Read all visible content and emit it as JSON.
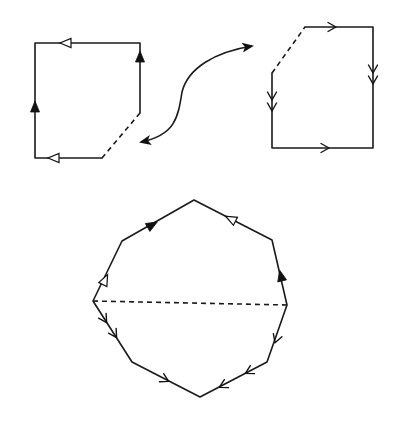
{
  "figure": {
    "line_color": "#1a1a1a",
    "background": "#ffffff",
    "pieces": [
      {
        "name": "left-piece",
        "edges": [
          {
            "name": "top",
            "style": "solid",
            "arrow": "open-triangle",
            "direction": "leftward"
          },
          {
            "name": "right",
            "style": "solid",
            "arrow": "filled-triangle",
            "direction": "upward"
          },
          {
            "name": "diagonal",
            "style": "dashed",
            "arrow": "none"
          },
          {
            "name": "bottom",
            "style": "solid",
            "arrow": "open-triangle",
            "direction": "leftward"
          },
          {
            "name": "left",
            "style": "solid",
            "arrow": "filled-triangle",
            "direction": "upward"
          }
        ]
      },
      {
        "name": "right-piece",
        "edges": [
          {
            "name": "top",
            "style": "solid",
            "arrow": "single-chevron",
            "direction": "rightward"
          },
          {
            "name": "right",
            "style": "solid",
            "arrow": "double-chevron",
            "direction": "downward"
          },
          {
            "name": "bottom",
            "style": "solid",
            "arrow": "single-chevron",
            "direction": "rightward"
          },
          {
            "name": "left",
            "style": "solid",
            "arrow": "double-chevron",
            "direction": "downward"
          },
          {
            "name": "diagonal",
            "style": "dashed",
            "arrow": "none"
          }
        ]
      }
    ],
    "connector": {
      "name": "double-headed-curved-arrow",
      "meaning": "pieces are glued along dashed edges"
    },
    "result": {
      "name": "octagon",
      "cut": "dashed horizontal diagonal",
      "edges": [
        {
          "name": "upper-left-lower",
          "arrow": "open-triangle"
        },
        {
          "name": "upper-left-upper",
          "arrow": "filled-triangle"
        },
        {
          "name": "upper-right-upper",
          "arrow": "open-triangle"
        },
        {
          "name": "upper-right-lower",
          "arrow": "filled-triangle"
        },
        {
          "name": "lower-right-upper",
          "arrow": "single-chevron"
        },
        {
          "name": "lower-right-lower",
          "arrow": "double-chevron"
        },
        {
          "name": "lower-left-lower",
          "arrow": "single-chevron"
        },
        {
          "name": "lower-left-upper",
          "arrow": "double-chevron"
        }
      ]
    }
  }
}
